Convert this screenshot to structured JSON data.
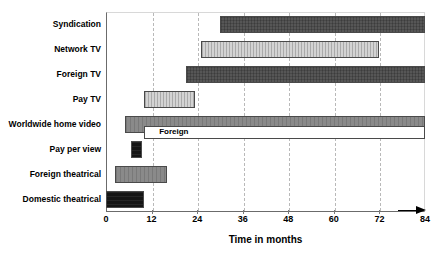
{
  "top_caption": "",
  "chart_data": {
    "type": "bar",
    "orientation": "horizontal",
    "subtype": "gantt-range",
    "title": "",
    "xlabel": "Time in months",
    "ylabel": "",
    "xlim": [
      0,
      84
    ],
    "xticks": [
      0,
      12,
      24,
      36,
      48,
      60,
      72,
      84
    ],
    "xtick_labels": [
      "0",
      "12",
      "24",
      "36",
      "48",
      "60",
      "72",
      "84"
    ],
    "grid": true,
    "grid_axis": "x",
    "grid_style": "dashed",
    "legend": "none",
    "categories": [
      "Syndication",
      "Network TV",
      "Foreign TV",
      "Pay TV",
      "Worldwide home video",
      "Pay per view",
      "Foreign theatrical",
      "Domestic theatrical"
    ],
    "bars": [
      {
        "label": "Syndication",
        "start": 30,
        "end": 84,
        "color": "#565656",
        "fill": "fill-dark",
        "annotation": ""
      },
      {
        "label": "Network TV",
        "start": 25,
        "end": 72,
        "color": "#d3d3d3",
        "fill": "fill-light",
        "annotation": ""
      },
      {
        "label": "Foreign TV",
        "start": 21,
        "end": 84,
        "color": "#565656",
        "fill": "fill-dark",
        "annotation": ""
      },
      {
        "label": "Pay TV",
        "start": 10,
        "end": 23.5,
        "color": "#b6b6b6",
        "fill": "fill-light",
        "annotation": ""
      },
      {
        "label": "Worldwide home video",
        "start": 5,
        "end": 84,
        "color": "#8a8a8a",
        "fill": "fill-medium",
        "annotation": ""
      },
      {
        "label": "Pay per view",
        "start": 6.5,
        "end": 9.5,
        "color": "#151515",
        "fill": "fill-black",
        "annotation": ""
      },
      {
        "label": "Foreign theatrical",
        "start": 2.5,
        "end": 16,
        "color": "#8a8a8a",
        "fill": "fill-medium",
        "annotation": ""
      },
      {
        "label": "Domestic theatrical",
        "start": 0,
        "end": 10,
        "color": "#151515",
        "fill": "fill-black",
        "annotation": ""
      }
    ],
    "sub_bars": [
      {
        "row": 4,
        "label": "Foreign",
        "start": 10,
        "end": 84,
        "color": "#ffffff",
        "fill": "fill-white"
      }
    ],
    "annotations": [
      {
        "text": "Foreign",
        "row": 4,
        "x": 14
      }
    ],
    "colors": {
      "dark_gray": "#565656",
      "light_gray": "#d3d3d3",
      "medium_gray": "#8a8a8a",
      "near_black": "#151515",
      "white": "#ffffff",
      "gridline": "#b9b9b9",
      "axis": "#6b6b6b"
    }
  }
}
